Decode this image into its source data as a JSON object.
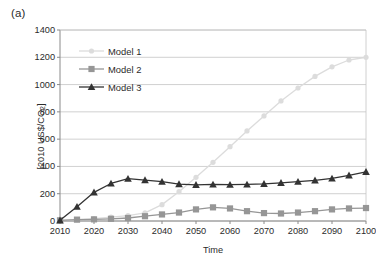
{
  "panel": {
    "label": "(a)"
  },
  "chart_data": {
    "type": "line",
    "title": "",
    "subtitle": "",
    "xlabel": "Time",
    "ylabel": "[2010 US$/CO2]",
    "ylabel_display": "[2010 US$/CO",
    "ylabel_sub": "2",
    "ylabel_tail": "]",
    "xlim": [
      2010,
      2100
    ],
    "ylim": [
      0,
      1400
    ],
    "grid": "horizontal",
    "legend_position": "upper-left-inside",
    "x": [
      2010,
      2015,
      2020,
      2025,
      2030,
      2035,
      2040,
      2045,
      2050,
      2055,
      2060,
      2065,
      2070,
      2075,
      2080,
      2085,
      2090,
      2095,
      2100
    ],
    "xticks": [
      2010,
      2020,
      2030,
      2040,
      2050,
      2060,
      2070,
      2080,
      2090,
      2100
    ],
    "yticks": [
      0,
      200,
      400,
      600,
      800,
      1000,
      1200,
      1400
    ],
    "series": [
      {
        "name": "Model 1",
        "color": "#dcdcdc",
        "marker": "circle",
        "values": [
          5,
          10,
          18,
          28,
          40,
          60,
          120,
          215,
          320,
          430,
          545,
          660,
          770,
          880,
          975,
          1060,
          1130,
          1180,
          1200
        ]
      },
      {
        "name": "Model 2",
        "color": "#969696",
        "marker": "square",
        "values": [
          5,
          10,
          12,
          16,
          22,
          35,
          48,
          62,
          85,
          100,
          92,
          72,
          58,
          55,
          62,
          72,
          85,
          92,
          95
        ]
      },
      {
        "name": "Model 3",
        "color": "#333333",
        "marker": "triangle",
        "values": [
          5,
          105,
          210,
          275,
          310,
          300,
          288,
          270,
          265,
          268,
          266,
          268,
          272,
          280,
          288,
          298,
          312,
          335,
          360
        ]
      }
    ]
  }
}
